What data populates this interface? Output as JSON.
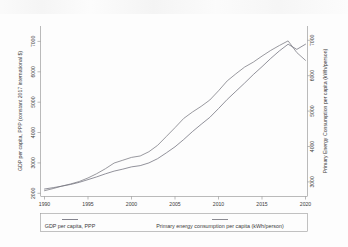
{
  "chart_data": {
    "type": "line",
    "title": "",
    "subtitle": "",
    "xlabel": "",
    "ylabel": "GDP per capita, PPP (constant 2017 international $)",
    "y2label": "Primary Energy Consumption per capita (kWh/person)",
    "xlim": [
      1990,
      2020
    ],
    "ylim": [
      1700,
      7300
    ],
    "y2lim": [
      2550,
      7350
    ],
    "grid": false,
    "legend_position": "bottom-outside",
    "x_ticks": [
      1990,
      1995,
      2000,
      2005,
      2010,
      2015,
      2020
    ],
    "x_tick_labels": [
      "1990",
      "1995",
      "2000",
      "2005",
      "2010",
      "2015",
      "2020"
    ],
    "y_ticks": [
      2000,
      3000,
      4000,
      5000,
      6000,
      7000
    ],
    "y_tick_labels": [
      "2000",
      "3000",
      "4000",
      "5000",
      "6000",
      "7000"
    ],
    "y2_ticks": [
      3000,
      4000,
      5000,
      6000,
      7000
    ],
    "y2_tick_labels": [
      "3000",
      "4000",
      "5000",
      "6000",
      "7000"
    ],
    "x": [
      1990,
      1991,
      1992,
      1993,
      1994,
      1995,
      1996,
      1997,
      1998,
      1999,
      2000,
      2001,
      2002,
      2003,
      2004,
      2005,
      2006,
      2007,
      2008,
      2009,
      2010,
      2011,
      2012,
      2013,
      2014,
      2015,
      2016,
      2017,
      2018,
      2019,
      2020
    ],
    "series": [
      {
        "name": "GDP per capita, PPP",
        "axis": "left",
        "color": "#6e6e7a",
        "values": [
          1930,
          1975,
          2025,
          2080,
          2150,
          2240,
          2330,
          2430,
          2520,
          2585,
          2660,
          2700,
          2790,
          2930,
          3120,
          3320,
          3560,
          3820,
          4060,
          4290,
          4580,
          4880,
          5150,
          5420,
          5700,
          5960,
          6230,
          6480,
          6700,
          6530,
          6700
        ]
      },
      {
        "name": "Primary energy consumption per capita (kWh/person)",
        "axis": "right",
        "color": "#77777f",
        "values": [
          2700,
          2760,
          2830,
          2890,
          2960,
          3060,
          3180,
          3320,
          3480,
          3560,
          3640,
          3680,
          3800,
          3980,
          4230,
          4480,
          4740,
          4920,
          5080,
          5260,
          5520,
          5800,
          6000,
          6190,
          6330,
          6500,
          6660,
          6800,
          6930,
          6600,
          6380
        ]
      }
    ],
    "legend": [
      {
        "label": "GDP per capita, PPP",
        "color": "#6e6e7a"
      },
      {
        "label": "Primary energy consumption per capita (kWh/person)",
        "color": "#77777f"
      }
    ]
  }
}
